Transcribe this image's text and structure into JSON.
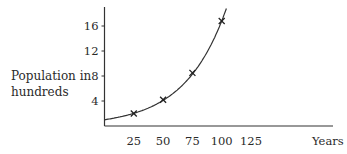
{
  "chart_data": {
    "type": "line",
    "title": "",
    "xlabel": "Years",
    "ylabel": "Population in hundreds",
    "x_ticks": [
      25,
      50,
      75,
      100,
      125
    ],
    "y_ticks": [
      4,
      8,
      12,
      16
    ],
    "xlim": [
      0,
      150
    ],
    "ylim": [
      0,
      19
    ],
    "grid": false,
    "legend": null,
    "series": [
      {
        "name": "Population",
        "style": "exponential curve with x markers",
        "points": [
          {
            "x": 25,
            "y": 2.0
          },
          {
            "x": 50,
            "y": 4.2
          },
          {
            "x": 75,
            "y": 8.5
          },
          {
            "x": 100,
            "y": 16.8
          }
        ],
        "curve_start": {
          "x": 0,
          "y": 1.0
        }
      }
    ]
  },
  "labels": {
    "ylabel_line1": "Population in",
    "ylabel_line2": "hundreds",
    "xlabel": "Years"
  }
}
